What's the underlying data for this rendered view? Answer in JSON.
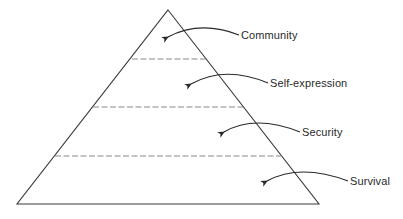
{
  "diagram": {
    "type": "pyramid",
    "colors": {
      "stroke": "#3a3a3a",
      "dash": "#7a7a7a",
      "text": "#2a2a2a",
      "background": "#ffffff"
    },
    "pyramid": {
      "apex": [
        168,
        10
      ],
      "bottom_left": [
        17,
        204
      ],
      "bottom_right": [
        319,
        204
      ]
    },
    "dividers": [
      {
        "y": 59,
        "x1": 132,
        "x2": 206
      },
      {
        "y": 107,
        "x1": 93,
        "x2": 243
      },
      {
        "y": 156,
        "x1": 55,
        "x2": 282
      }
    ],
    "levels": [
      {
        "label": "Community",
        "text_pos": [
          241,
          29
        ],
        "arrow": {
          "start": [
            239,
            35
          ],
          "ctrl": [
            200,
            20
          ],
          "end": [
            168,
            37
          ]
        }
      },
      {
        "label": "Self-expression",
        "text_pos": [
          270,
          77
        ],
        "arrow": {
          "start": [
            268,
            83
          ],
          "ctrl": [
            225,
            65
          ],
          "end": [
            191,
            84
          ]
        }
      },
      {
        "label": "Security",
        "text_pos": [
          302,
          126
        ],
        "arrow": {
          "start": [
            300,
            132
          ],
          "ctrl": [
            255,
            114
          ],
          "end": [
            224,
            132
          ]
        }
      },
      {
        "label": "Survival",
        "text_pos": [
          350,
          175
        ],
        "arrow": {
          "start": [
            348,
            181
          ],
          "ctrl": [
            300,
            163
          ],
          "end": [
            267,
            181
          ]
        }
      }
    ]
  }
}
